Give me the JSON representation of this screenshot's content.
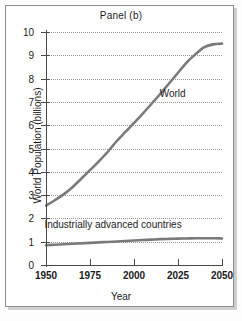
{
  "figure": {
    "title": "Panel (b)",
    "background": "#ffffff",
    "frame_color": "#8d8d8d"
  },
  "chart_data": {
    "type": "line",
    "title": "Panel (b)",
    "xlabel": "Year",
    "ylabel": "World Population (billions)",
    "xlim": [
      1950,
      2050
    ],
    "ylim": [
      0,
      10
    ],
    "xticks": [
      1950,
      1975,
      2000,
      2025,
      2050
    ],
    "yticks": [
      0,
      1,
      2,
      3,
      4,
      5,
      6,
      7,
      8,
      9,
      10
    ],
    "grid": "horizontal-dotted",
    "legend": "inline-annotations",
    "series_color": "#7a7a7a",
    "x": [
      1950,
      1955,
      1960,
      1965,
      1970,
      1975,
      1980,
      1985,
      1990,
      1995,
      2000,
      2005,
      2010,
      2015,
      2020,
      2025,
      2030,
      2035,
      2040,
      2045,
      2050
    ],
    "series": [
      {
        "name": "World",
        "label": "World",
        "color": "#7a7a7a",
        "values": [
          2.55,
          2.78,
          3.03,
          3.34,
          3.7,
          4.07,
          4.45,
          4.85,
          5.3,
          5.7,
          6.1,
          6.5,
          6.92,
          7.35,
          7.8,
          8.25,
          8.7,
          9.05,
          9.35,
          9.47,
          9.5
        ]
      },
      {
        "name": "Industrially advanced countries",
        "label": "Industrially advanced countries",
        "color": "#7a7a7a",
        "values": [
          0.85,
          0.87,
          0.89,
          0.91,
          0.93,
          0.95,
          0.97,
          0.99,
          1.01,
          1.03,
          1.05,
          1.07,
          1.09,
          1.11,
          1.12,
          1.13,
          1.14,
          1.15,
          1.15,
          1.15,
          1.14
        ]
      }
    ],
    "annotations": [
      {
        "text": "World",
        "x": 2022,
        "y": 7.35
      },
      {
        "text": "Industrially advanced countries",
        "x": 1988,
        "y": 1.72
      }
    ]
  }
}
